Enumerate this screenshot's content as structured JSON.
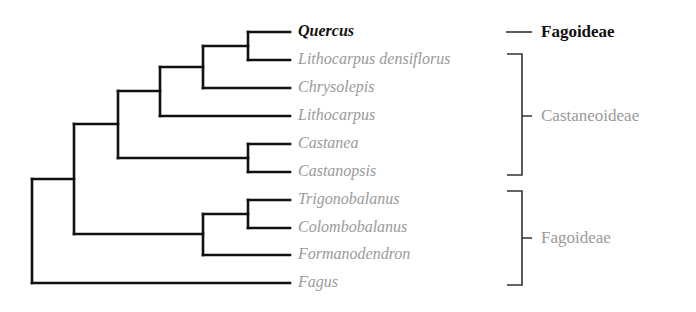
{
  "diagram": {
    "type": "phylogenetic-tree",
    "colors": {
      "branch": "#111111",
      "highlight_text": "#111111",
      "muted_text": "#9a9a9a",
      "bracket": "#333333"
    },
    "taxa": [
      {
        "name": "Quercus",
        "highlight": true,
        "y": 32
      },
      {
        "name": "Lithocarpus densiflorus",
        "highlight": false,
        "y": 60
      },
      {
        "name": "Chrysolepis",
        "highlight": false,
        "y": 88
      },
      {
        "name": "Lithocarpus",
        "highlight": false,
        "y": 116
      },
      {
        "name": "Castanea",
        "highlight": false,
        "y": 144
      },
      {
        "name": "Castanopsis",
        "highlight": false,
        "y": 172
      },
      {
        "name": "Trigonobalanus",
        "highlight": false,
        "y": 200
      },
      {
        "name": "Colombobalanus",
        "highlight": false,
        "y": 228
      },
      {
        "name": "Formanodendron",
        "highlight": false,
        "y": 255
      },
      {
        "name": "Fagus",
        "highlight": false,
        "y": 283
      }
    ],
    "groups": [
      {
        "label": "Fagoideae",
        "highlight": true,
        "members": [
          "Quercus"
        ]
      },
      {
        "label": "Castaneoideae",
        "highlight": false,
        "members": [
          "Lithocarpus densiflorus",
          "Chrysolepis",
          "Lithocarpus",
          "Castanea",
          "Castanopsis"
        ]
      },
      {
        "label": "Fagoideae",
        "highlight": false,
        "members": [
          "Trigonobalanus",
          "Colombobalanus",
          "Formanodendron",
          "Fagus"
        ]
      }
    ],
    "topology": "((((((Quercus,Lithocarpus densiflorus),Chrysolepis),Lithocarpus),(Castanea,Castanopsis)),((Trigonobalanus,Colombobalanus),Formanodendron)),Fagus)"
  }
}
